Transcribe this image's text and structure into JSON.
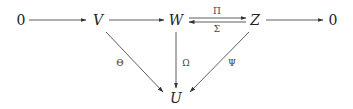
{
  "diagram": {
    "type": "commutative-diagram",
    "nodes": [
      {
        "id": "zero_left",
        "label": "0",
        "x": 21,
        "y": 20
      },
      {
        "id": "V",
        "label": "V",
        "x": 98,
        "y": 20
      },
      {
        "id": "W",
        "label": "W",
        "x": 176,
        "y": 20
      },
      {
        "id": "Z",
        "label": "Z",
        "x": 255,
        "y": 20
      },
      {
        "id": "zero_right",
        "label": "0",
        "x": 333,
        "y": 20
      },
      {
        "id": "U",
        "label": "U",
        "x": 176,
        "y": 98
      }
    ],
    "edges": [
      {
        "from": "zero_left",
        "to": "V",
        "label": ""
      },
      {
        "from": "V",
        "to": "W",
        "label": ""
      },
      {
        "from": "W",
        "to": "Z",
        "label": "Π"
      },
      {
        "from": "Z",
        "to": "W",
        "label": "Σ"
      },
      {
        "from": "Z",
        "to": "zero_right",
        "label": ""
      },
      {
        "from": "V",
        "to": "U",
        "label": "Θ"
      },
      {
        "from": "W",
        "to": "U",
        "label": "Ω"
      },
      {
        "from": "Z",
        "to": "U",
        "label": "Ψ"
      }
    ]
  },
  "labels": {
    "zero_left": "0",
    "V": "V",
    "W": "W",
    "Z": "Z",
    "zero_right": "0",
    "U": "U",
    "pi": "Π",
    "sigma": "Σ",
    "theta": "Θ",
    "omega": "Ω",
    "psi": "Ψ"
  }
}
